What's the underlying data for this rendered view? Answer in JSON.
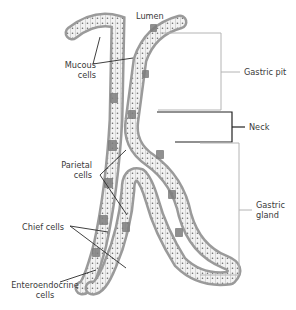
{
  "labels": {
    "lumen": "Lumen",
    "mucous_1": "Mucous",
    "mucous_2": "cells",
    "parietal_1": "Parietal",
    "parietal_2": "cells",
    "chief": "Chief cells",
    "entero_1": "Enteroendocrine",
    "entero_2": "cells",
    "gastric_pit": "Gastric pit",
    "neck": "Neck",
    "gastric_gland_1": "Gastric",
    "gastric_gland_2": "gland"
  },
  "colors": {
    "tissue_outer": "#9a9a9a",
    "tissue_fill": "#d6d6d6",
    "cell_fill": "#f4f4f4",
    "dark_cell": "#7d7d7d",
    "bracket_light": "#b4b4b4",
    "bracket_dark": "#222222",
    "leader": "#2a2a2a",
    "text": "#3a3a3a"
  }
}
